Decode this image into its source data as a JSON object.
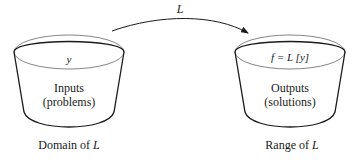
{
  "diagram": {
    "arrow": {
      "label": "L",
      "from": "domain",
      "to": "range"
    },
    "domain": {
      "top_label": "y",
      "body_line1": "Inputs",
      "body_line2": "(problems)",
      "caption_prefix": "Domain of ",
      "caption_var": "L"
    },
    "range": {
      "top_label": "f = L [y]",
      "body_line1": "Outputs",
      "body_line2": "(solutions)",
      "caption_prefix": "Range of ",
      "caption_var": "L"
    },
    "colors": {
      "stroke": "#1a1a1a",
      "top_ellipse": "#555555",
      "background": "#ffffff"
    }
  }
}
